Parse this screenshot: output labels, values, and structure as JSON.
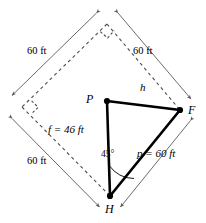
{
  "figure": {
    "type": "geometry-diagram",
    "colors": {
      "stroke": "#000000",
      "dashed_stroke": "#4d4d4d",
      "dimension_stroke": "#5a5a5a",
      "background": "#ffffff"
    },
    "vertices": [
      {
        "name": "vertex-p",
        "label": "P",
        "x": 107,
        "y": 101,
        "label_x": 86,
        "label_y": 93
      },
      {
        "name": "vertex-f",
        "label": "F",
        "x": 180,
        "y": 110,
        "label_x": 188,
        "label_y": 106
      },
      {
        "name": "vertex-h",
        "label": "H",
        "x": 110,
        "y": 196,
        "label_x": 105,
        "label_y": 203
      }
    ],
    "square": {
      "name": "dashed-square",
      "corners": [
        {
          "name": "square-top",
          "x": 107,
          "y": 24
        },
        {
          "name": "square-right",
          "x": 180,
          "y": 110
        },
        {
          "name": "square-bottom",
          "x": 110,
          "y": 196
        },
        {
          "name": "square-left",
          "x": 22,
          "y": 107
        }
      ],
      "right_angle_marks": [
        "square-top",
        "square-left"
      ]
    },
    "triangle_sides": [
      {
        "name": "side-ph",
        "label": "f = 46 ft",
        "from": "P",
        "to": "H",
        "label_x": 48,
        "label_y": 129
      },
      {
        "name": "side-pf",
        "label": "h",
        "from": "P",
        "to": "F",
        "label_x": 140,
        "label_y": 87
      },
      {
        "name": "side-hf",
        "label": "p = 60 ft",
        "from": "H",
        "to": "F",
        "label_x": 143,
        "label_y": 153
      }
    ],
    "angle": {
      "name": "angle-at-h",
      "label": "45°",
      "value": 45,
      "unit": "degrees",
      "at_vertex": "H",
      "label_x": 101,
      "label_y": 155
    },
    "dimensions": [
      {
        "name": "dimension-top-left",
        "label": "60 ft",
        "label_x": 27,
        "label_y": 51
      },
      {
        "name": "dimension-top-right",
        "label": "60 ft",
        "label_x": 133,
        "label_y": 51
      },
      {
        "name": "dimension-bottom-left",
        "label": "60 ft",
        "label_x": 27,
        "label_y": 161
      },
      {
        "name": "dimension-bottom-right",
        "label": "p = 60 ft",
        "label_x": 143,
        "label_y": 153
      }
    ]
  }
}
